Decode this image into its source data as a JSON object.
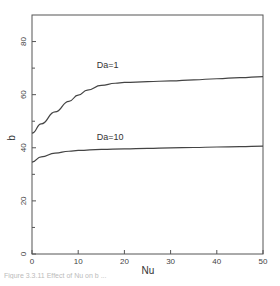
{
  "chart_data": {
    "type": "line",
    "title": "",
    "xlabel": "Nu",
    "ylabel": "b",
    "xlim": [
      0,
      50
    ],
    "ylim": [
      0,
      90
    ],
    "x_ticks": [
      0,
      10,
      20,
      30,
      40,
      50
    ],
    "y_ticks": [
      0,
      20,
      40,
      60,
      80
    ],
    "y_minor_ticks": [
      10,
      30,
      50,
      70
    ],
    "grid": false,
    "legend": "inline labels",
    "series": [
      {
        "name": "Da=1",
        "x": [
          0,
          2,
          5,
          8,
          10,
          12,
          15,
          18,
          20,
          25,
          30,
          35,
          40,
          45,
          50
        ],
        "values": [
          45.5,
          49,
          53.5,
          57.5,
          59.8,
          61.7,
          63.5,
          64.3,
          64.6,
          64.9,
          65.2,
          65.6,
          66.0,
          66.4,
          66.8
        ]
      },
      {
        "name": "Da=10",
        "x": [
          0,
          2,
          5,
          8,
          10,
          15,
          20,
          25,
          30,
          35,
          40,
          45,
          50
        ],
        "values": [
          34.6,
          36.6,
          38.0,
          38.7,
          39.0,
          39.4,
          39.6,
          39.8,
          40.0,
          40.1,
          40.3,
          40.4,
          40.6
        ]
      }
    ],
    "annotations": [
      {
        "text": "Da=1",
        "x": 14,
        "y": 70
      },
      {
        "text": "Da=10",
        "x": 14,
        "y": 43
      }
    ]
  },
  "caption": "Figure 3.3.11 Effect of Nu on b ..."
}
